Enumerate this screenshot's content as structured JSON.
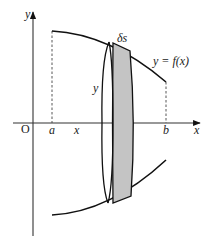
{
  "figure": {
    "labels": {
      "y_axis": "y",
      "x_axis": "x",
      "origin": "O",
      "a": "a",
      "x_pos": "x",
      "b": "b",
      "delta_s": "δs",
      "function": "y = f(x)",
      "radius": "y"
    },
    "colors": {
      "line": "#111111",
      "shade": "#c4c4c4",
      "background": "#ffffff"
    }
  }
}
